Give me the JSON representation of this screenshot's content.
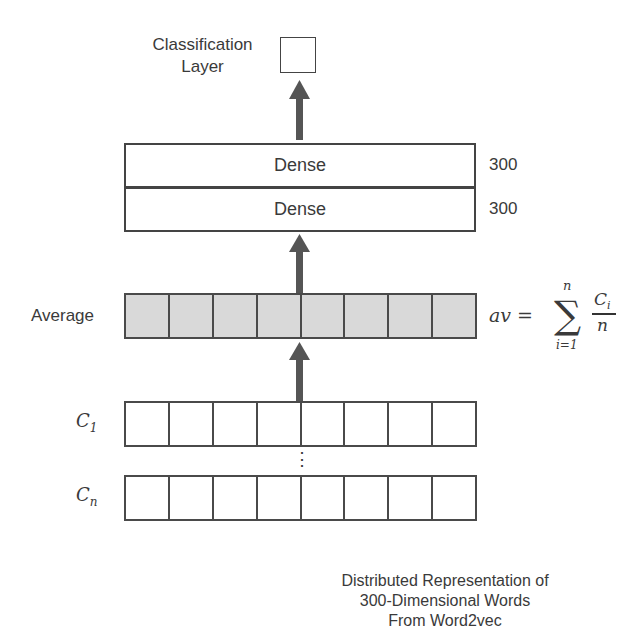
{
  "diagram": {
    "classification_layer": {
      "label_line1": "Classification",
      "label_line2": "Layer"
    },
    "dense_layers": [
      {
        "label": "Dense",
        "size": "300"
      },
      {
        "label": "Dense",
        "size": "300"
      }
    ],
    "average": {
      "label": "Average",
      "cells": 8,
      "formula": {
        "lhs": "av =",
        "sum_upper": "n",
        "sum_lower": "i=1",
        "numerator": "C",
        "numerator_sub": "i",
        "denominator": "n"
      }
    },
    "inputs": [
      {
        "label": "C",
        "sub": "1",
        "cells": 8
      },
      {
        "label": "C",
        "sub": "n",
        "cells": 8
      }
    ],
    "ellipsis": "⋮",
    "caption": {
      "line1": "Distributed Representation of",
      "line2": "300-Dimensional Words",
      "line3": "From Word2vec"
    },
    "colors": {
      "arrow": "#555555",
      "average_fill": "#d9d9d9",
      "border": "#444444"
    }
  }
}
